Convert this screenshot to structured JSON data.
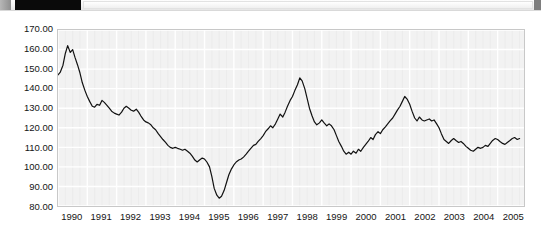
{
  "toolbar": {
    "left_tab_name": "toolbar-handle",
    "dark_block_name": "redacted-title-block",
    "field_placeholder": "",
    "field_value": "",
    "right_block_name": "toolbar-end-marker"
  },
  "chart_data": {
    "type": "line",
    "title": "",
    "subtitle": "",
    "xlabel": "",
    "ylabel": "",
    "grid": true,
    "legend": false,
    "legend_position": "none",
    "line_color": "#111111",
    "plot_background": "#f2f2f2",
    "xlim": [
      1990.0,
      2005.9
    ],
    "ylim": [
      80,
      170
    ],
    "ytick_labels": [
      "170.00",
      "160.00",
      "150.00",
      "140.00",
      "130.00",
      "120.00",
      "110.00",
      "100.00",
      "90.00",
      "80.00"
    ],
    "ytick_values": [
      170,
      160,
      150,
      140,
      130,
      120,
      110,
      100,
      90,
      80
    ],
    "xtick_labels": [
      "1990",
      "1991",
      "1992",
      "1993",
      "1994",
      "1995",
      "1996",
      "1997",
      "1998",
      "1999",
      "2000",
      "2001",
      "2002",
      "2003",
      "2004",
      "2005"
    ],
    "xtick_values": [
      1990,
      1991,
      1992,
      1993,
      1994,
      1995,
      1996,
      1997,
      1998,
      1999,
      2000,
      2001,
      2002,
      2003,
      2004,
      2005
    ],
    "series": [
      {
        "name": "index",
        "x": [
          1990.0,
          1990.08,
          1990.17,
          1990.25,
          1990.33,
          1990.42,
          1990.5,
          1990.58,
          1990.67,
          1990.75,
          1990.83,
          1990.92,
          1991.0,
          1991.08,
          1991.17,
          1991.25,
          1991.33,
          1991.42,
          1991.5,
          1991.58,
          1991.67,
          1991.75,
          1991.83,
          1991.92,
          1992.0,
          1992.08,
          1992.17,
          1992.25,
          1992.33,
          1992.42,
          1992.5,
          1992.58,
          1992.67,
          1992.75,
          1992.83,
          1992.92,
          1993.0,
          1993.08,
          1993.17,
          1993.25,
          1993.33,
          1993.42,
          1993.5,
          1993.58,
          1993.67,
          1993.75,
          1993.83,
          1993.92,
          1994.0,
          1994.08,
          1994.17,
          1994.25,
          1994.33,
          1994.42,
          1994.5,
          1994.58,
          1994.67,
          1994.75,
          1994.83,
          1994.92,
          1995.0,
          1995.08,
          1995.17,
          1995.25,
          1995.33,
          1995.42,
          1995.5,
          1995.58,
          1995.67,
          1995.75,
          1995.83,
          1995.92,
          1996.0,
          1996.08,
          1996.17,
          1996.25,
          1996.33,
          1996.42,
          1996.5,
          1996.58,
          1996.67,
          1996.75,
          1996.83,
          1996.92,
          1997.0,
          1997.08,
          1997.17,
          1997.25,
          1997.33,
          1997.42,
          1997.5,
          1997.58,
          1997.67,
          1997.75,
          1997.83,
          1997.92,
          1998.0,
          1998.08,
          1998.17,
          1998.25,
          1998.33,
          1998.42,
          1998.5,
          1998.58,
          1998.67,
          1998.75,
          1998.83,
          1998.92,
          1999.0,
          1999.08,
          1999.17,
          1999.25,
          1999.33,
          1999.42,
          1999.5,
          1999.58,
          1999.67,
          1999.75,
          1999.83,
          1999.92,
          2000.0,
          2000.08,
          2000.17,
          2000.25,
          2000.33,
          2000.42,
          2000.5,
          2000.58,
          2000.67,
          2000.75,
          2000.83,
          2000.92,
          2001.0,
          2001.08,
          2001.17,
          2001.25,
          2001.33,
          2001.42,
          2001.5,
          2001.58,
          2001.67,
          2001.75,
          2001.83,
          2001.92,
          2002.0,
          2002.08,
          2002.17,
          2002.25,
          2002.33,
          2002.42,
          2002.5,
          2002.58,
          2002.67,
          2002.75,
          2002.83,
          2002.92,
          2003.0,
          2003.08,
          2003.17,
          2003.25,
          2003.33,
          2003.42,
          2003.5,
          2003.58,
          2003.67,
          2003.75,
          2003.83,
          2003.92,
          2004.0,
          2004.08,
          2004.17,
          2004.25,
          2004.33,
          2004.42,
          2004.5,
          2004.58,
          2004.67,
          2004.75,
          2004.83,
          2004.92,
          2005.0,
          2005.08,
          2005.17,
          2005.25,
          2005.33,
          2005.42,
          2005.5,
          2005.58,
          2005.67,
          2005.75
        ],
        "values": [
          147.0,
          148.5,
          152.0,
          158.0,
          162.0,
          158.5,
          160.0,
          156.0,
          152.0,
          148.0,
          143.0,
          139.0,
          136.0,
          133.5,
          131.0,
          130.5,
          132.0,
          131.5,
          134.0,
          133.0,
          131.5,
          130.0,
          128.5,
          127.5,
          127.0,
          126.5,
          128.0,
          130.0,
          131.0,
          130.0,
          129.0,
          128.5,
          129.5,
          128.0,
          126.0,
          124.0,
          123.0,
          122.5,
          121.5,
          120.0,
          119.0,
          117.0,
          115.5,
          114.0,
          112.5,
          111.0,
          110.0,
          109.5,
          110.0,
          109.5,
          109.0,
          108.5,
          109.0,
          108.0,
          107.0,
          105.5,
          103.5,
          102.5,
          103.5,
          104.5,
          104.0,
          102.5,
          100.0,
          95.0,
          89.0,
          85.5,
          84.0,
          85.0,
          88.0,
          92.0,
          96.0,
          99.0,
          101.0,
          102.5,
          103.5,
          104.0,
          105.0,
          106.5,
          108.0,
          109.5,
          111.0,
          111.5,
          113.0,
          114.5,
          116.0,
          118.0,
          119.5,
          121.0,
          120.0,
          122.0,
          124.5,
          127.0,
          125.5,
          128.0,
          131.0,
          134.0,
          136.0,
          139.0,
          142.0,
          145.5,
          144.0,
          140.0,
          135.0,
          130.0,
          126.0,
          123.0,
          121.5,
          122.5,
          124.0,
          122.5,
          121.0,
          122.0,
          121.0,
          119.0,
          116.0,
          113.0,
          110.5,
          108.0,
          106.5,
          107.5,
          106.5,
          108.0,
          107.0,
          109.0,
          108.0,
          110.0,
          111.5,
          113.0,
          115.0,
          114.0,
          116.5,
          118.0,
          117.0,
          119.0,
          120.5,
          122.0,
          123.5,
          125.0,
          127.0,
          129.0,
          131.0,
          133.5,
          136.0,
          134.5,
          132.0,
          128.5,
          125.0,
          123.5,
          125.5,
          124.0,
          123.5,
          124.0,
          124.5,
          123.5,
          124.0,
          122.0,
          120.0,
          117.0,
          114.0,
          113.0,
          112.0,
          113.5,
          114.5,
          113.5,
          112.5,
          113.0,
          112.0,
          110.5,
          109.5,
          108.5,
          108.0,
          109.0,
          110.0,
          109.5,
          110.0,
          111.0,
          110.5,
          112.0,
          113.5,
          114.5,
          114.0,
          113.0,
          112.0,
          111.5,
          112.5,
          113.5,
          114.5,
          115.0,
          114.0,
          114.5
        ]
      }
    ]
  }
}
